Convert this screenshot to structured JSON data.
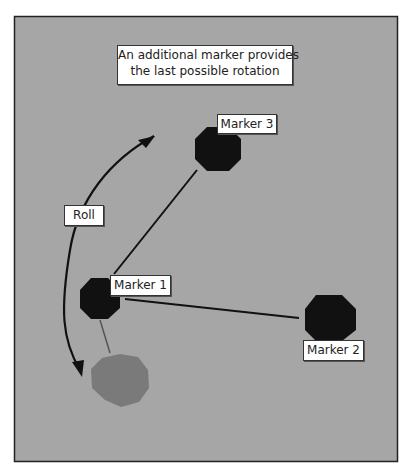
{
  "diagram": {
    "background_color": "#a6a6a6",
    "frame_color": "#222222",
    "caption": {
      "line1": "An additional marker provides",
      "line2": "the last possible rotation"
    },
    "markers": [
      {
        "id": "marker-1",
        "label": "Marker 1",
        "color": "#111111"
      },
      {
        "id": "marker-2",
        "label": "Marker 2",
        "color": "#111111"
      },
      {
        "id": "marker-3",
        "label": "Marker 3",
        "color": "#111111"
      },
      {
        "id": "ghost-marker",
        "label": "",
        "color": "#7a7a7a"
      }
    ],
    "rotation_label": "Roll"
  }
}
